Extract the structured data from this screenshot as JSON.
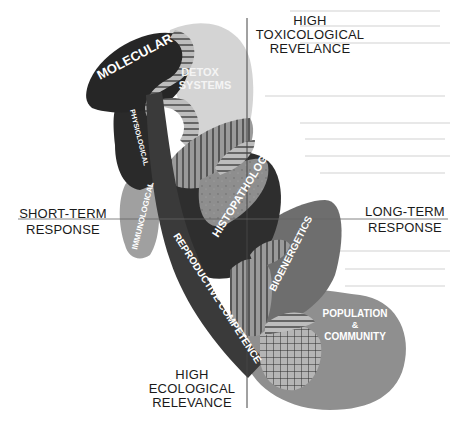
{
  "figure": {
    "axes": {
      "top": [
        "HIGH",
        "TOXICOLOGICAL",
        "REVELANCE"
      ],
      "bottom": [
        "HIGH",
        "ECOLOGICAL",
        "RELEVANCE"
      ],
      "left": [
        "SHORT-TERM",
        "RESPONSE"
      ],
      "right": [
        "LONG-TERM",
        "RESPONSE"
      ]
    },
    "regions": {
      "molecular": "MOLECULAR",
      "detox_line1": "DETOX",
      "detox_line2": "SYSTEMS",
      "physiological": "PHYSIOLOGICAL",
      "immunological": "IMMUNOLOGICAL",
      "histopathology": "HISTOPATHOLOGY",
      "reproductive": "REPRODUCTIVE COMPETENCE",
      "bioenergetics": "BIOENERGETICS",
      "population_line1": "POPULATION",
      "population_line2": "&",
      "population_line3": "COMMUNITY"
    },
    "colors": {
      "dark": "#2b2b2b",
      "darkmid": "#3d3d3d",
      "mid": "#7a7a7a",
      "light": "#a8a8a8",
      "pale": "#d9d9d9",
      "axis": "#444444"
    }
  }
}
